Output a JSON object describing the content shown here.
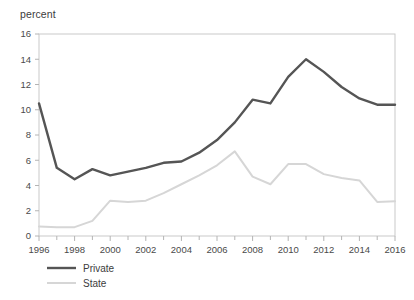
{
  "chart_data": {
    "type": "line",
    "title": "",
    "subtitle": "",
    "xlabel": "",
    "ylabel": "percent",
    "ylim": [
      0,
      16
    ],
    "xlim": [
      1996,
      2016
    ],
    "ytick_step": 2,
    "xtick_step": 2,
    "grid": false,
    "legend_position": "bottom-left",
    "x": [
      1996,
      1997,
      1998,
      1999,
      2000,
      2001,
      2002,
      2003,
      2004,
      2005,
      2006,
      2007,
      2008,
      2009,
      2010,
      2011,
      2012,
      2013,
      2014,
      2015,
      2016
    ],
    "yticks": [
      0,
      2,
      4,
      6,
      8,
      10,
      12,
      14,
      16
    ],
    "ytick_labels": [
      "0",
      "2",
      "4",
      "6",
      "8",
      "10",
      "12",
      "14",
      "16"
    ],
    "xticks": [
      1996,
      1998,
      2000,
      2002,
      2004,
      2006,
      2008,
      2010,
      2012,
      2014,
      2016
    ],
    "xtick_labels": [
      "1996",
      "1998",
      "2000",
      "2002",
      "2004",
      "2006",
      "2008",
      "2010",
      "2012",
      "2014",
      "2016"
    ],
    "xminor_ticks": [
      1997,
      1999,
      2001,
      2003,
      2005,
      2007,
      2009,
      2011,
      2013,
      2015
    ],
    "series": [
      {
        "name": "Private",
        "color": "#555555",
        "width": 2.4,
        "values": [
          10.5,
          5.4,
          4.5,
          5.3,
          4.8,
          5.1,
          5.4,
          5.8,
          5.9,
          6.6,
          7.6,
          9.0,
          10.8,
          10.5,
          12.6,
          14.0,
          13.0,
          11.8,
          10.9,
          10.4,
          10.4
        ]
      },
      {
        "name": "State",
        "color": "#d6d6d6",
        "width": 2.0,
        "values": [
          0.75,
          0.7,
          0.7,
          1.2,
          2.8,
          2.7,
          2.8,
          3.4,
          4.1,
          4.8,
          5.6,
          6.7,
          4.7,
          4.1,
          5.7,
          5.7,
          4.9,
          4.6,
          4.4,
          2.7,
          2.75
        ]
      }
    ]
  },
  "legend": {
    "items": [
      {
        "label": "Private"
      },
      {
        "label": "State"
      }
    ]
  }
}
